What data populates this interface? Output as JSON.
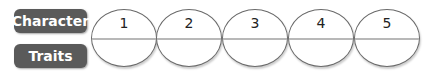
{
  "labels": {
    "top": "Character",
    "bottom": "Traits"
  },
  "ovals": [
    {
      "number": "1",
      "top_text": "",
      "bottom_text": ""
    },
    {
      "number": "2",
      "top_text": "",
      "bottom_text": ""
    },
    {
      "number": "3",
      "top_text": "",
      "bottom_text": ""
    },
    {
      "number": "4",
      "top_text": "",
      "bottom_text": ""
    },
    {
      "number": "5",
      "top_text": "",
      "bottom_text": ""
    }
  ],
  "colors": {
    "label_bg": "#5a5a5a",
    "label_text": "#ffffff",
    "oval_border": "#6a6a6a",
    "divider": "#b8b8b8"
  }
}
